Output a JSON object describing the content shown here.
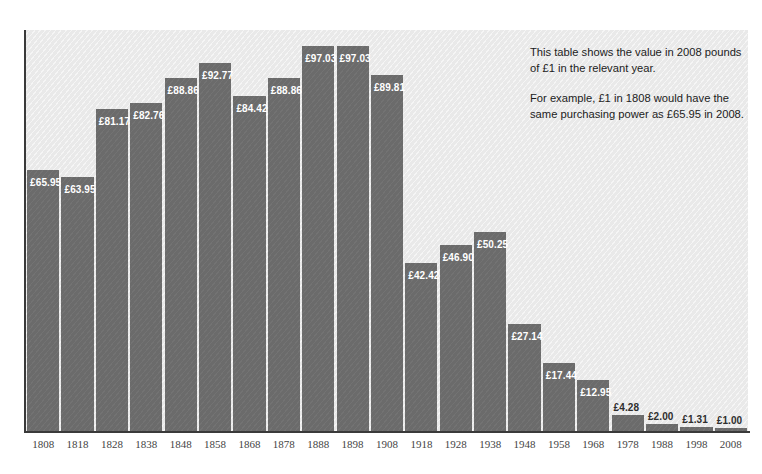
{
  "chart_data": {
    "type": "bar",
    "title": "",
    "subtitle": "",
    "xlabel": "",
    "ylabel": "",
    "grid": false,
    "legend": "none",
    "ylim": [
      0,
      101
    ],
    "value_prefix": "£",
    "categories": [
      "1808",
      "1818",
      "1828",
      "1838",
      "1848",
      "1858",
      "1868",
      "1878",
      "1888",
      "1898",
      "1908",
      "1918",
      "1928",
      "1938",
      "1948",
      "1958",
      "1968",
      "1978",
      "1988",
      "1998",
      "2008"
    ],
    "values": [
      65.95,
      63.95,
      81.17,
      82.76,
      88.86,
      92.77,
      84.42,
      88.86,
      97.03,
      97.03,
      89.81,
      42.42,
      46.9,
      50.25,
      27.14,
      17.44,
      12.95,
      4.28,
      2.0,
      1.31,
      1.0
    ],
    "data_labels": [
      "£65.95",
      "£63.95",
      "£81.17",
      "£82.76",
      "£88.86",
      "£92.77",
      "£84.42",
      "£88.86",
      "£97.03",
      "£97.03",
      "£89.81",
      "£42.42",
      "£46.90",
      "£50.25",
      "£27.14",
      "£17.44",
      "£12.95",
      "£4.28",
      "£2.00",
      "£1.31",
      "£1.00"
    ],
    "annotations": [
      "This table shows the value in 2008 pounds of £1 in the relevant year.",
      "For example, £1 in 1808 would have the same purchasing power as £65.95 in 2008."
    ],
    "colors": {
      "bar": "#6b6b6b",
      "plot_background": "#e9e9e9",
      "axis": "#3a3a3a",
      "inside_label": "#ffffff",
      "above_label": "#2e2e2e",
      "tick_label": "#444444",
      "annotation_text": "#1c1c1c",
      "page_background": "#ffffff"
    }
  },
  "annotation": {
    "line1": "This table shows the value in 2008 pounds",
    "line2": "of £1 in the relevant year.",
    "line3": "For example, £1 in 1808 would have the",
    "line4": "same purchasing power as £65.95 in 2008."
  }
}
